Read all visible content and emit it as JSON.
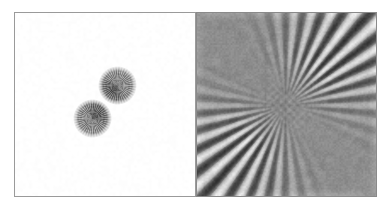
{
  "figure": {
    "type": "image-pair",
    "background_color": "#ffffff",
    "width": 388,
    "height": 209
  },
  "panels": [
    {
      "id": "particles",
      "name": "left-panel-particles",
      "position": "left",
      "frame": {
        "x": 14,
        "y": 12,
        "width": 182,
        "height": 185
      },
      "background_color": "#ffffff",
      "border_color": "#9a9a9a",
      "content_type": "reconstructed-particle-image",
      "objects": [
        {
          "name": "particle-upper-right",
          "shape": "sphere",
          "center_x": 117,
          "center_y": 85,
          "radius": 18,
          "texture": "radial-striations",
          "mean_gray": "#8f8f8f",
          "dark_lobe": "lower-left",
          "dark_gray": "#4e4e4e"
        },
        {
          "name": "particle-lower-left",
          "shape": "sphere",
          "center_x": 92,
          "center_y": 118,
          "radius": 18,
          "texture": "radial-striations",
          "mean_gray": "#909090",
          "dark_lobe": "upper-right",
          "dark_gray": "#4a4a4a"
        }
      ]
    },
    {
      "id": "fringes",
      "name": "right-panel-fringes",
      "position": "right",
      "frame": {
        "x": 196,
        "y": 12,
        "width": 181,
        "height": 185
      },
      "background_color": "#8d8d8d",
      "border_color": "#8a8a8a",
      "content_type": "radial-interference-fringe-pattern",
      "pattern": {
        "kind": "radial-fan-fringes",
        "center_x": 285,
        "center_y": 105,
        "fringe_count": 34,
        "bright_gray": "#eeeeee",
        "dark_gray": "#242424",
        "mid_gray": "#8d8d8d",
        "active_quadrants": [
          "upper-left",
          "lower-right"
        ],
        "flat_quadrants": [
          "upper-right",
          "lower-left"
        ],
        "core_radius": 26,
        "noise": "fine-speckle"
      }
    }
  ],
  "chart_data": {
    "type": "heatmap",
    "title": "",
    "xlabel": "",
    "ylabel": "",
    "panels": [
      {
        "label": "particles",
        "series": [
          {
            "name": "particle-upper-right",
            "x": 117,
            "y": 85,
            "r": 18
          },
          {
            "name": "particle-lower-left",
            "x": 92,
            "y": 118,
            "r": 18
          }
        ]
      },
      {
        "label": "fringes",
        "center": [
          285,
          105
        ],
        "fringe_count": 34,
        "orientation_deg": 135
      }
    ]
  }
}
